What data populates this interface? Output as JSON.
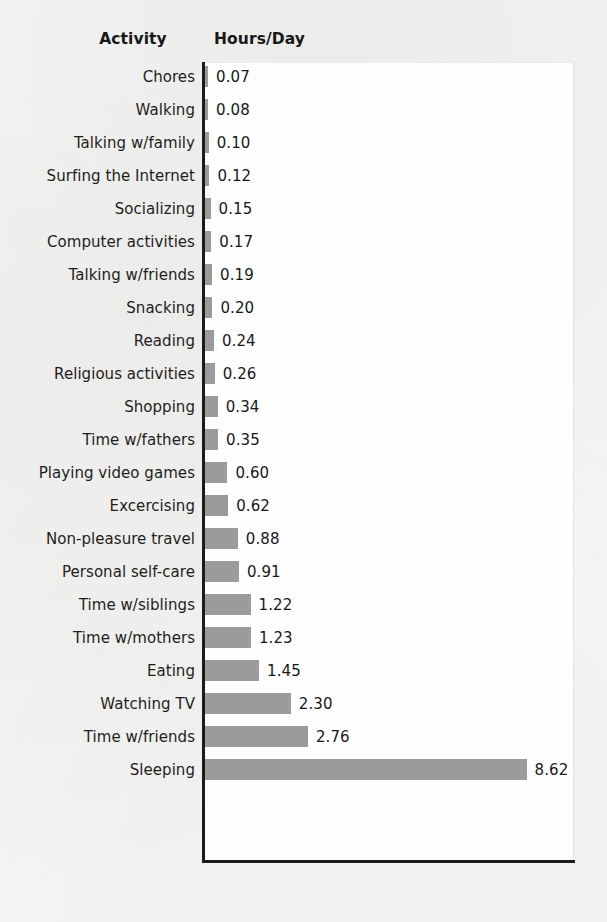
{
  "figure": {
    "headers": {
      "activity": "Activity",
      "hours": "Hours/Day"
    },
    "bar_color": "#9b9b9b",
    "axis_color": "#1b1b1b",
    "plot_background": "#fefefe",
    "page_background": "#f6f6f5"
  },
  "chart_data": {
    "type": "bar",
    "orientation": "horizontal",
    "title": "",
    "subtitle": "",
    "xlabel": "Hours/Day",
    "ylabel": "Activity",
    "grid": false,
    "legend": null,
    "xlim": [
      0,
      9.95
    ],
    "value_labels": true,
    "categories": [
      "Chores",
      "Walking",
      "Talking w/family",
      "Surfing the Internet",
      "Socializing",
      "Computer activities",
      "Talking w/friends",
      "Snacking",
      "Reading",
      "Religious activities",
      "Shopping",
      "Time w/fathers",
      "Playing video games",
      "Excercising",
      "Non-pleasure travel",
      "Personal self-care",
      "Time w/siblings",
      "Time w/mothers",
      "Eating",
      "Watching TV",
      "Time w/friends",
      "Sleeping"
    ],
    "values": [
      0.07,
      0.08,
      0.1,
      0.12,
      0.15,
      0.17,
      0.19,
      0.2,
      0.24,
      0.26,
      0.34,
      0.35,
      0.6,
      0.62,
      0.88,
      0.91,
      1.22,
      1.23,
      1.45,
      2.3,
      2.76,
      8.62
    ],
    "value_label_texts": [
      "0.07",
      "0.08",
      "0.10",
      "0.12",
      "0.15",
      "0.17",
      "0.19",
      "0.20",
      "0.24",
      "0.26",
      "0.34",
      "0.35",
      "0.60",
      "0.62",
      "0.88",
      "0.91",
      "1.22",
      "1.23",
      "1.45",
      "2.30",
      "2.76",
      "8.62"
    ]
  }
}
